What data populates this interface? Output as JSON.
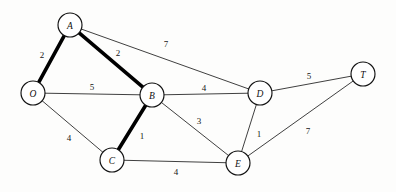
{
  "diagram": {
    "type": "node-link-graph",
    "background_color": "#fdfdfc",
    "line_color": "#1c1c1c",
    "node_fill": "#ffffff",
    "node_radius": 12,
    "highlight_style": "bold-stroke",
    "nodes": [
      {
        "id": "A",
        "label": "A",
        "x": 70,
        "y": 25
      },
      {
        "id": "O",
        "label": "O",
        "x": 33,
        "y": 93
      },
      {
        "id": "B",
        "label": "B",
        "x": 152,
        "y": 95
      },
      {
        "id": "C",
        "label": "C",
        "x": 112,
        "y": 160
      },
      {
        "id": "D",
        "label": "D",
        "x": 260,
        "y": 93
      },
      {
        "id": "E",
        "label": "E",
        "x": 238,
        "y": 163
      },
      {
        "id": "T",
        "label": "T",
        "x": 363,
        "y": 74
      }
    ],
    "edges": [
      {
        "from": "O",
        "to": "A",
        "weight": "2",
        "bold": true,
        "label_x": 42,
        "label_y": 55
      },
      {
        "from": "A",
        "to": "B",
        "weight": "2",
        "bold": true,
        "label_x": 118,
        "label_y": 53
      },
      {
        "from": "A",
        "to": "D",
        "weight": "7",
        "bold": false,
        "label_x": 166,
        "label_y": 44
      },
      {
        "from": "O",
        "to": "B",
        "weight": "5",
        "bold": false,
        "label_x": 92,
        "label_y": 87
      },
      {
        "from": "O",
        "to": "C",
        "weight": "4",
        "bold": false,
        "label_x": 69,
        "label_y": 138
      },
      {
        "from": "B",
        "to": "C",
        "weight": "1",
        "bold": true,
        "label_x": 142,
        "label_y": 136
      },
      {
        "from": "B",
        "to": "D",
        "weight": "4",
        "bold": false,
        "label_x": 204,
        "label_y": 88
      },
      {
        "from": "B",
        "to": "E",
        "weight": "3",
        "bold": false,
        "label_x": 199,
        "label_y": 121
      },
      {
        "from": "C",
        "to": "E",
        "weight": "4",
        "bold": false,
        "label_x": 176,
        "label_y": 172
      },
      {
        "from": "D",
        "to": "E",
        "weight": "1",
        "bold": false,
        "label_x": 259,
        "label_y": 134
      },
      {
        "from": "D",
        "to": "T",
        "weight": "5",
        "bold": false,
        "label_x": 309,
        "label_y": 76
      },
      {
        "from": "E",
        "to": "T",
        "weight": "7",
        "bold": false,
        "label_x": 308,
        "label_y": 131
      }
    ]
  }
}
